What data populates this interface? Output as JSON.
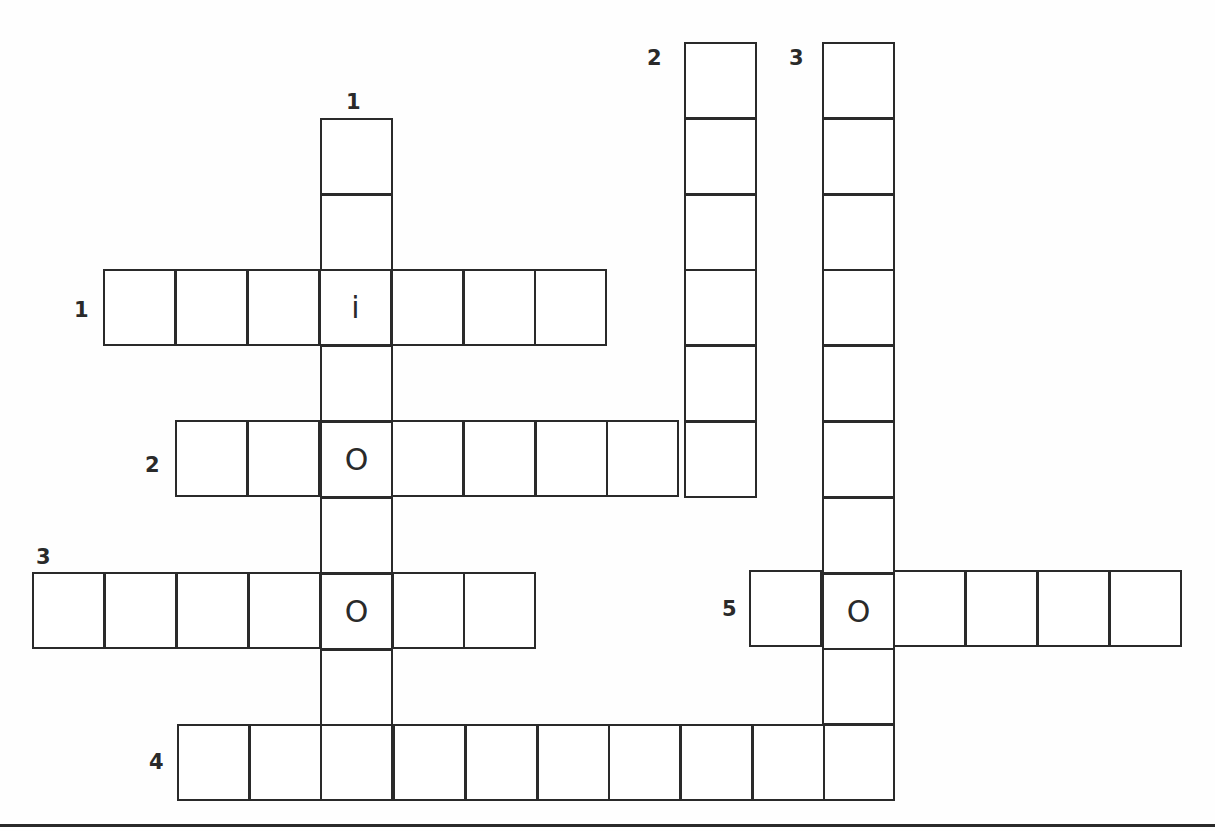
{
  "puzzle": {
    "type": "crossword",
    "cell_width": 73,
    "cell_height": 77,
    "line_color": "#2a2a2a",
    "background": "#ffffff"
  },
  "entries": [
    {
      "id": "down-1",
      "direction": "down",
      "number": "1",
      "x": 320,
      "y": 118,
      "length": 9,
      "label_x": 346,
      "label_y": 92,
      "letters": {
        "2": "i",
        "4": "O",
        "6": "O"
      }
    },
    {
      "id": "down-2",
      "direction": "down",
      "number": "2",
      "x": 684,
      "y": 42,
      "length": 6,
      "label_x": 647,
      "label_y": 48,
      "letters": {}
    },
    {
      "id": "down-3",
      "direction": "down",
      "number": "3",
      "x": 822,
      "y": 42,
      "length": 10,
      "label_x": 789,
      "label_y": 48,
      "letters": {
        "7": "O"
      }
    },
    {
      "id": "across-1",
      "direction": "across",
      "number": "1",
      "x": 103,
      "y": 269,
      "length": 7,
      "label_x": 74,
      "label_y": 300,
      "letters": {
        "3": "i"
      }
    },
    {
      "id": "across-2",
      "direction": "across",
      "number": "2",
      "x": 175,
      "y": 420,
      "length": 8,
      "label_x": 145,
      "label_y": 455,
      "letters": {
        "2": "O"
      }
    },
    {
      "id": "across-3",
      "direction": "across",
      "number": "3",
      "x": 32,
      "y": 572,
      "length": 7,
      "label_x": 36,
      "label_y": 547,
      "letters": {
        "4": "O"
      }
    },
    {
      "id": "across-4",
      "direction": "across",
      "number": "4",
      "x": 177,
      "y": 724,
      "length": 10,
      "label_x": 149,
      "label_y": 752,
      "letters": {}
    },
    {
      "id": "across-5",
      "direction": "across",
      "number": "5",
      "x": 749,
      "y": 570,
      "length": 6,
      "label_x": 722,
      "label_y": 599,
      "letters": {
        "1": "O"
      }
    }
  ],
  "given_letters": [
    "i",
    "O",
    "O",
    "O"
  ]
}
